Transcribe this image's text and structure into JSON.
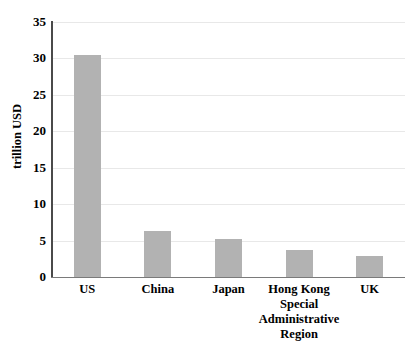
{
  "chart_data": {
    "type": "bar",
    "title": "",
    "subtitle": "",
    "xlabel": "",
    "ylabel": "trillion USD",
    "ylim": [
      0,
      35
    ],
    "ytick_step": 5,
    "yticks": [
      "35",
      "30",
      "25",
      "20",
      "15",
      "10",
      "5",
      "0"
    ],
    "grid": true,
    "legend": "none",
    "bar_color": "#b2b2b2",
    "axis_color": "#4a4a4a",
    "gridline_color": "#e8e8e8",
    "categories": [
      "US",
      "China",
      "Japan",
      "Hong Kong Special Administrative Region",
      "UK"
    ],
    "category_label_lines": [
      [
        "US"
      ],
      [
        "China"
      ],
      [
        "Japan"
      ],
      [
        "Hong Kong",
        "Special",
        "Administrative",
        "Region"
      ],
      [
        "UK"
      ]
    ],
    "values": [
      30.5,
      6.3,
      5.2,
      3.7,
      2.9
    ]
  }
}
